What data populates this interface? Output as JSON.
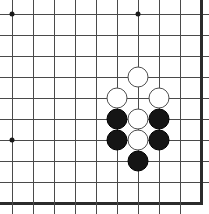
{
  "board": {
    "title": "Go board position",
    "type": "go-board",
    "width_px": 209,
    "height_px": 214,
    "grid": {
      "columns": 10,
      "rows": 10,
      "spacing_px": 21,
      "origin_x_px": 12,
      "origin_y_px": 14,
      "line_color": "#4a4a4a",
      "edge_color": "#2b2b2b",
      "background_color": "#ffffff",
      "cropped_edges": [
        "top",
        "left"
      ],
      "thick_edges": [
        "right",
        "bottom"
      ]
    },
    "star_points": [
      {
        "col": 0,
        "row": 0
      },
      {
        "col": 6,
        "row": 0
      },
      {
        "col": 0,
        "row": 6
      }
    ],
    "stones": [
      {
        "color": "white",
        "col": 6,
        "row": 3
      },
      {
        "color": "white",
        "col": 5,
        "row": 4
      },
      {
        "color": "white",
        "col": 7,
        "row": 4
      },
      {
        "color": "black",
        "col": 5,
        "row": 5
      },
      {
        "color": "white",
        "col": 6,
        "row": 5
      },
      {
        "color": "black",
        "col": 7,
        "row": 5
      },
      {
        "color": "black",
        "col": 5,
        "row": 6
      },
      {
        "color": "white",
        "col": 6,
        "row": 6
      },
      {
        "color": "black",
        "col": 7,
        "row": 6
      },
      {
        "color": "black",
        "col": 6,
        "row": 7
      }
    ],
    "colors": {
      "white_stone_fill": "#ffffff",
      "white_stone_border": "#4f4f4f",
      "black_stone_fill": "#151515",
      "black_stone_border": "#000000",
      "star_point": "#1a1a1a"
    },
    "counts": {
      "white_stones": 5,
      "black_stones": 5,
      "total_stones": 10
    }
  }
}
